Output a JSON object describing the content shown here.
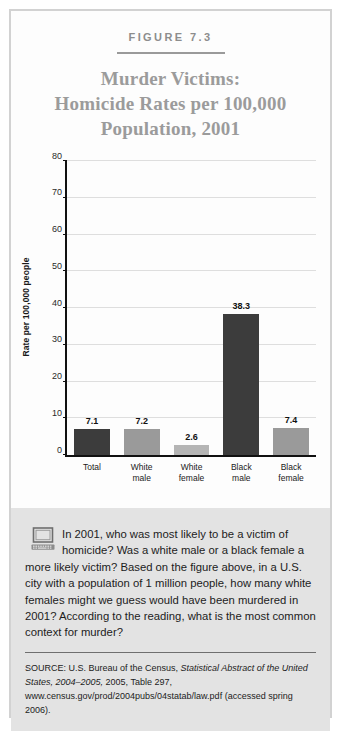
{
  "figure": {
    "number_label": "FIGURE 7.3",
    "title_lines": [
      "Murder Victims:",
      "Homicide Rates per 100,000",
      "Population, 2001"
    ]
  },
  "chart_data": {
    "type": "bar",
    "title": "Murder Victims: Homicide Rates per 100,000 Population, 2001",
    "categories": [
      "Total",
      "White male",
      "White female",
      "Black male",
      "Black female"
    ],
    "category_lines": [
      [
        "Total",
        ""
      ],
      [
        "White",
        "male"
      ],
      [
        "White",
        "female"
      ],
      [
        "Black",
        "male"
      ],
      [
        "Black",
        "female"
      ]
    ],
    "values": [
      7.1,
      7.2,
      2.6,
      38.3,
      7.4
    ],
    "value_labels": [
      "7.1",
      "7.2",
      "2.6",
      "38.3",
      "7.4"
    ],
    "bar_colors": [
      "#3c3c3c",
      "#9a9a9a",
      "#b5b5b5",
      "#3c3c3c",
      "#9a9a9a"
    ],
    "xlabel": "",
    "ylabel": "Rate per 100,000 people",
    "ylim": [
      0,
      80
    ],
    "yticks": [
      0,
      10,
      20,
      30,
      40,
      50,
      60,
      70,
      80
    ],
    "ytick_labels": [
      "0",
      "10",
      "20",
      "30",
      "40",
      "50",
      "60",
      "70",
      "80"
    ],
    "grid": true,
    "legend": "none"
  },
  "question": {
    "icon": "desktop-computer-icon",
    "text": "In 2001, who was most likely to be a victim of homicide? Was a white male or a black female a more likely victim? Based on the figure above, in a U.S. city with a population of 1 million people, how many white females might we guess would have been murdered in 2001? According to the reading, what is the most common context for murder?"
  },
  "source": {
    "prefix": "SOURCE: U.S. Bureau of the Census, ",
    "italic": "Statistical Abstract of the United States, 2004–2005,",
    "suffix": " 2005, Table 297, www.census.gov/prod/2004pubs/04statab/law.pdf (accessed spring 2006)."
  },
  "colors": {
    "frame_border": "#d2d2d2",
    "title_gray": "#9b9b9b",
    "question_bg": "#e3e3e3",
    "axis": "#111111",
    "gridline": "#dedede"
  }
}
